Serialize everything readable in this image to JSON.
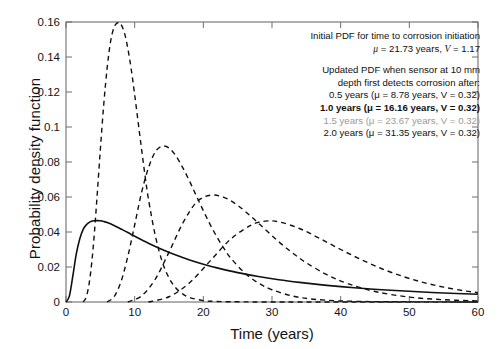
{
  "chart_data": {
    "type": "line",
    "title": "",
    "xlabel": "Time (years)",
    "ylabel": "Probability density function",
    "xlim": [
      0,
      60
    ],
    "ylim": [
      0,
      0.16
    ],
    "xticks": [
      0,
      10,
      20,
      30,
      40,
      50,
      60
    ],
    "yticks": [
      "0",
      "0.02",
      "0.04",
      "0.06",
      "0.08",
      "0.1",
      "0.12",
      "0.14",
      "0.16"
    ],
    "grid": false,
    "legend_position": "top-right",
    "series": [
      {
        "name": "Initial PDF for time to corrosion initiation",
        "style": "solid",
        "color": "#111111",
        "mu": 21.73,
        "V": 1.17,
        "peak_x": 5.5,
        "peak_y": 0.0465,
        "x": [
          0,
          0.5,
          1,
          1.5,
          2,
          2.5,
          3,
          3.5,
          4,
          4.5,
          5,
          5.5,
          6,
          7,
          8,
          9,
          10,
          12,
          14,
          16,
          18,
          20,
          22,
          25,
          28,
          31,
          34,
          38,
          42,
          46,
          50,
          55,
          60
        ],
        "y": [
          0,
          0.0035,
          0.015,
          0.0275,
          0.036,
          0.0415,
          0.0443,
          0.0458,
          0.0464,
          0.0465,
          0.0464,
          0.046,
          0.0454,
          0.0437,
          0.0417,
          0.0397,
          0.0376,
          0.0336,
          0.03,
          0.0268,
          0.024,
          0.0216,
          0.0195,
          0.0168,
          0.0146,
          0.0127,
          0.0112,
          0.0095,
          0.0081,
          0.007,
          0.0061,
          0.0051,
          0.0044
        ]
      },
      {
        "name": "0.5 years",
        "style": "dashed",
        "color": "#111111",
        "mu": 8.78,
        "V": 0.32,
        "detect_after": 0.5,
        "peak_x": 7.8,
        "peak_y": 0.1595,
        "x": [
          2.5,
          3,
          3.5,
          4,
          4.5,
          5,
          5.5,
          6,
          6.5,
          7,
          7.5,
          7.8,
          8,
          8.5,
          9,
          9.5,
          10,
          10.5,
          11,
          11.5,
          12,
          13,
          14,
          15,
          16,
          17,
          18,
          20,
          22,
          25,
          30,
          40,
          60
        ],
        "y": [
          0,
          0.0035,
          0.014,
          0.033,
          0.059,
          0.087,
          0.113,
          0.134,
          0.149,
          0.157,
          0.1595,
          0.1595,
          0.1588,
          0.154,
          0.145,
          0.133,
          0.1185,
          0.103,
          0.0875,
          0.0725,
          0.059,
          0.038,
          0.0232,
          0.0138,
          0.008,
          0.0046,
          0.0026,
          0.0008,
          0.0003,
          0.0001,
          0,
          0,
          0
        ]
      },
      {
        "name": "1.0 years",
        "style": "dashed",
        "color": "#111111",
        "mu": 16.16,
        "V": 0.32,
        "detect_after": 1.0,
        "peak_x": 14.0,
        "peak_y": 0.089,
        "x": [
          6,
          7,
          8,
          9,
          10,
          11,
          12,
          13,
          14,
          15,
          16,
          17,
          18,
          19,
          20,
          21,
          22,
          23,
          24,
          26,
          28,
          30,
          33,
          36,
          40,
          45,
          50,
          60
        ],
        "y": [
          0,
          0.003,
          0.0115,
          0.026,
          0.044,
          0.0625,
          0.0765,
          0.0858,
          0.089,
          0.088,
          0.0835,
          0.0768,
          0.069,
          0.0605,
          0.0522,
          0.0442,
          0.037,
          0.0306,
          0.0251,
          0.0167,
          0.0109,
          0.007,
          0.0034,
          0.0016,
          0.0006,
          0.0002,
          0.0001,
          0
        ]
      },
      {
        "name": "1.5 years",
        "style": "dashed",
        "color": "#111111",
        "mu": 23.67,
        "V": 0.32,
        "detect_after": 1.5,
        "peak_x": 21.0,
        "peak_y": 0.061,
        "x": [
          9,
          11,
          13,
          15,
          17,
          19,
          21,
          23,
          25,
          27,
          29,
          31,
          33,
          35,
          38,
          41,
          45,
          50,
          55,
          60
        ],
        "y": [
          0,
          0.0035,
          0.013,
          0.0285,
          0.045,
          0.057,
          0.061,
          0.0598,
          0.0552,
          0.0487,
          0.0415,
          0.0344,
          0.028,
          0.0224,
          0.0156,
          0.0106,
          0.006,
          0.0028,
          0.0013,
          0.0006
        ]
      },
      {
        "name": "2.0 years",
        "style": "dashed",
        "color": "#111111",
        "mu": 31.35,
        "V": 0.32,
        "detect_after": 2.0,
        "peak_x": 29.0,
        "peak_y": 0.0462,
        "x": [
          12,
          15,
          18,
          21,
          24,
          27,
          29,
          31,
          34,
          37,
          40,
          43,
          46,
          49,
          52,
          55,
          58,
          60
        ],
        "y": [
          0,
          0.003,
          0.011,
          0.0235,
          0.036,
          0.044,
          0.0462,
          0.0458,
          0.042,
          0.0362,
          0.03,
          0.0242,
          0.019,
          0.0147,
          0.0112,
          0.0085,
          0.0064,
          0.0053
        ]
      }
    ]
  },
  "legend": {
    "block1": {
      "line1": "Initial PDF for time to corrosion initiation",
      "line2": "(μ = 21.73 years, V = 1.17)"
    },
    "block2": {
      "line1": "Updated PDF when sensor at 10 mm",
      "line2": "depth first detects corrosion after:",
      "entries": [
        "0.5 years (μ = 8.78 years, V = 0.32)",
        "1.0 years (μ = 16.16 years, V = 0.32)",
        "1.5 years (μ = 23.67 years, V = 0.32)",
        "2.0 years (μ = 31.35 years, V = 0.32)"
      ]
    }
  },
  "axes": {
    "x_label": "Time (years)",
    "y_label": "Probability density function",
    "x_ticks": [
      "0",
      "10",
      "20",
      "30",
      "40",
      "50",
      "60"
    ],
    "y_ticks": [
      "0",
      "0.02",
      "0.04",
      "0.06",
      "0.08",
      "0.1",
      "0.12",
      "0.14",
      "0.16"
    ]
  }
}
